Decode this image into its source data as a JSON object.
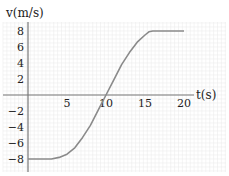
{
  "chart_data": {
    "type": "line",
    "title": "",
    "xlabel": "t(s)",
    "ylabel": "v(m/s)",
    "xlim": [
      0,
      21
    ],
    "ylim": [
      -9.5,
      9.5
    ],
    "grid": true,
    "x_ticks": [
      5,
      10,
      15,
      20
    ],
    "x_tick_labels": [
      "5",
      "10",
      "15",
      "20"
    ],
    "y_ticks": [
      8,
      6,
      4,
      2,
      -2,
      -4,
      -6,
      -8
    ],
    "y_tick_labels": [
      "8",
      "6",
      "4",
      "2",
      "−2",
      "−4",
      "−6",
      "−8"
    ],
    "series": [
      {
        "name": "v(t)",
        "x": [
          0,
          3,
          4,
          5,
          6,
          7,
          8,
          9,
          10,
          11,
          12,
          13,
          14,
          15,
          15.5,
          16,
          20
        ],
        "y": [
          -8,
          -8,
          -7.8,
          -7.4,
          -6.6,
          -5.3,
          -3.8,
          -1.9,
          0,
          1.9,
          3.8,
          5.3,
          6.6,
          7.5,
          7.9,
          8,
          8
        ]
      }
    ],
    "legend": null
  },
  "colors": {
    "line": "#8a8a8a",
    "axis": "#777777",
    "grid": "#ececec"
  }
}
